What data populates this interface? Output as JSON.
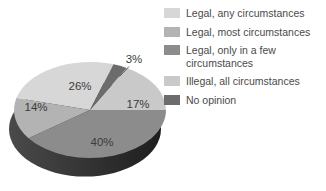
{
  "chart_data": {
    "type": "pie",
    "projection": "3d",
    "title": "",
    "legend_position": "right",
    "direction": "counterclockwise",
    "start_angle_deg": 72,
    "categories": [
      "Legal, any circumstances",
      "Legal, most circumstances",
      "Legal, only in a few circumstances",
      "Illegal, all circumstances",
      "No opinion"
    ],
    "values": [
      26,
      14,
      40,
      17,
      3
    ],
    "slice_labels": [
      "26%",
      "14%",
      "40%",
      "17%",
      "3%"
    ],
    "colors": [
      "#d7d7d7",
      "#b3b3b3",
      "#8c8c8c",
      "#c9c9c9",
      "#6c6c6c"
    ],
    "depth_color_left": "#4a4a4a",
    "depth_color_right": "#1e1e1e",
    "slice_label_color": "#3b3b3b",
    "legend_text_color": "#4a4a4a",
    "background": "#ffffff"
  }
}
